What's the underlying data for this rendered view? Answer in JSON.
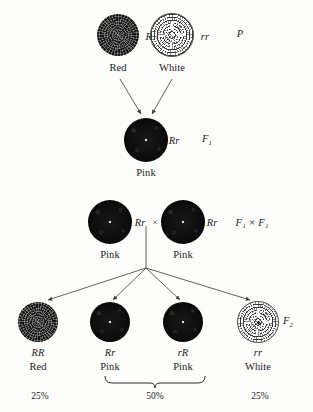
{
  "diagram": {
    "title_text": "",
    "generations": [
      {
        "tag": "P",
        "tag_sub": "",
        "tag_x": 240,
        "tag_y": 33,
        "organisms": [
          {
            "genotype": "RR",
            "phenotype": "Red",
            "color_class": "red",
            "x": 118,
            "y": 35,
            "size": 42,
            "genotype_x": 152,
            "genotype_y": 36,
            "phenotype_x": 118,
            "phenotype_y": 67
          },
          {
            "genotype": "rr",
            "phenotype": "White",
            "color_class": "white",
            "x": 172,
            "y": 35,
            "size": 42,
            "genotype_x": 205,
            "genotype_y": 36,
            "phenotype_x": 172,
            "phenotype_y": 67
          }
        ]
      },
      {
        "tag": "F",
        "tag_sub": "1",
        "tag_x": 207,
        "tag_y": 140,
        "organisms": [
          {
            "genotype": "Rr",
            "phenotype": "Pink",
            "color_class": "dark",
            "x": 146,
            "y": 140,
            "size": 44,
            "genotype_x": 174,
            "genotype_y": 140,
            "phenotype_x": 146,
            "phenotype_y": 172
          }
        ]
      },
      {
        "tag": "F",
        "tag_sub": "1",
        "tag_cross": "F₁ × F₁",
        "tag_x": 252,
        "tag_y": 222,
        "organisms": [
          {
            "genotype": "Rr",
            "phenotype": "Pink",
            "color_class": "dark",
            "x": 110,
            "y": 222,
            "size": 44,
            "genotype_x": 140,
            "genotype_y": 222,
            "phenotype_x": 110,
            "phenotype_y": 254
          },
          {
            "genotype": "Rr",
            "phenotype": "Pink",
            "color_class": "dark",
            "x": 183,
            "y": 222,
            "size": 44,
            "genotype_x": 212,
            "genotype_y": 222,
            "phenotype_x": 183,
            "phenotype_y": 254
          }
        ],
        "cross_symbol": "×",
        "cross_symbol_x": 155,
        "cross_symbol_y": 222
      },
      {
        "tag": "F",
        "tag_sub": "2",
        "tag_x": 288,
        "tag_y": 322,
        "organisms": [
          {
            "genotype": "RR",
            "phenotype": "Red",
            "color_class": "red",
            "x": 38,
            "y": 322,
            "size": 40,
            "genotype_x": 38,
            "genotype_y": 352,
            "phenotype_x": 38,
            "phenotype_y": 366,
            "percent": "25%",
            "percent_x": 40,
            "percent_y": 396
          },
          {
            "genotype": "Rr",
            "phenotype": "Pink",
            "color_class": "dark",
            "x": 110,
            "y": 322,
            "size": 40,
            "genotype_x": 110,
            "genotype_y": 352,
            "phenotype_x": 110,
            "phenotype_y": 366,
            "percent": "",
            "percent_x": 0,
            "percent_y": 0
          },
          {
            "genotype": "rR",
            "phenotype": "Pink",
            "color_class": "dark",
            "x": 183,
            "y": 322,
            "size": 40,
            "genotype_x": 183,
            "genotype_y": 352,
            "phenotype_x": 183,
            "phenotype_y": 366,
            "percent": "",
            "percent_x": 0,
            "percent_y": 0
          },
          {
            "genotype": "rr",
            "phenotype": "White",
            "color_class": "white",
            "x": 258,
            "y": 322,
            "size": 40,
            "genotype_x": 258,
            "genotype_y": 352,
            "phenotype_x": 258,
            "phenotype_y": 366,
            "percent": "25%",
            "percent_x": 260,
            "percent_y": 396
          }
        ],
        "brace_percent": "50%",
        "brace_percent_x": 155,
        "brace_percent_y": 396
      }
    ],
    "colors": {
      "ink": "#1b1b1b",
      "line": "#4a4a4a",
      "background": "#fdfdfc",
      "dark_flower": "#0d0d0d",
      "white_flower": "#ffffff"
    }
  }
}
